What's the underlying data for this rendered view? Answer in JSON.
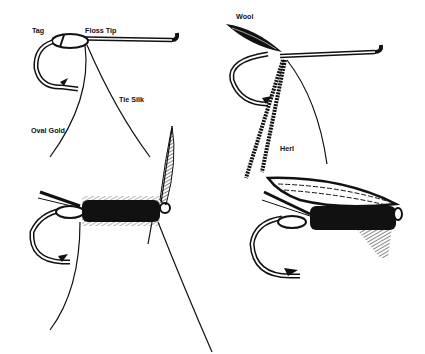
{
  "figure": {
    "panels": [
      {
        "id": "step1",
        "labels": [
          "Tag",
          "Floss Tip",
          "Tie Silk",
          "Oval Gold"
        ]
      },
      {
        "id": "step2",
        "labels": [
          "Wool",
          "Herl"
        ]
      },
      {
        "id": "step3",
        "labels": []
      },
      {
        "id": "step4",
        "labels": []
      }
    ],
    "labels": {
      "tag": "Tag",
      "floss_tip": "Floss Tip",
      "tie_silk": "Tie Silk",
      "oval_gold": "Oval Gold",
      "wool": "Wool",
      "herl": "Herl"
    },
    "colors": {
      "ink": "#111111",
      "paper": "#ffffff"
    }
  }
}
